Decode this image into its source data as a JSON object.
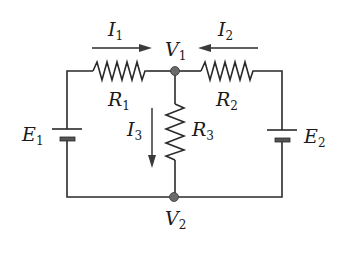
{
  "diagram": {
    "type": "circuit-schematic",
    "nodes": [
      {
        "id": "V1",
        "label": "V",
        "sub": "1"
      },
      {
        "id": "V2",
        "label": "V",
        "sub": "2"
      }
    ],
    "resistors": [
      {
        "id": "R1",
        "label": "R",
        "sub": "1"
      },
      {
        "id": "R2",
        "label": "R",
        "sub": "2"
      },
      {
        "id": "R3",
        "label": "R",
        "sub": "3"
      }
    ],
    "sources": [
      {
        "id": "E1",
        "label": "E",
        "sub": "1"
      },
      {
        "id": "E2",
        "label": "E",
        "sub": "2"
      }
    ],
    "currents": [
      {
        "id": "I1",
        "label": "I",
        "sub": "1",
        "direction": "right"
      },
      {
        "id": "I2",
        "label": "I",
        "sub": "2",
        "direction": "left"
      },
      {
        "id": "I3",
        "label": "I",
        "sub": "3",
        "direction": "down"
      }
    ],
    "colors": {
      "line": "#2a2a2a",
      "node": "#6a6a6a",
      "background": "#ffffff"
    }
  }
}
